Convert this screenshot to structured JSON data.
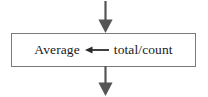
{
  "diagram": {
    "type": "flowchart-process-step",
    "colors": {
      "background": "#ffffff",
      "box_border": "#7a7a7a",
      "box_fill": "#ffffff",
      "arrow": "#555555",
      "text": "#1a1a1a"
    },
    "incoming_arrow": {
      "name": "incoming-flow-arrow",
      "direction": "down",
      "label": ""
    },
    "process_box": {
      "name": "process-box",
      "statement": {
        "target": "Average",
        "operator": "←",
        "operator_name": "assignment-arrow-left",
        "expression": "total/count",
        "full_text": "Average ← total/count"
      }
    },
    "outgoing_arrow": {
      "name": "outgoing-flow-arrow",
      "direction": "down",
      "label": ""
    }
  }
}
